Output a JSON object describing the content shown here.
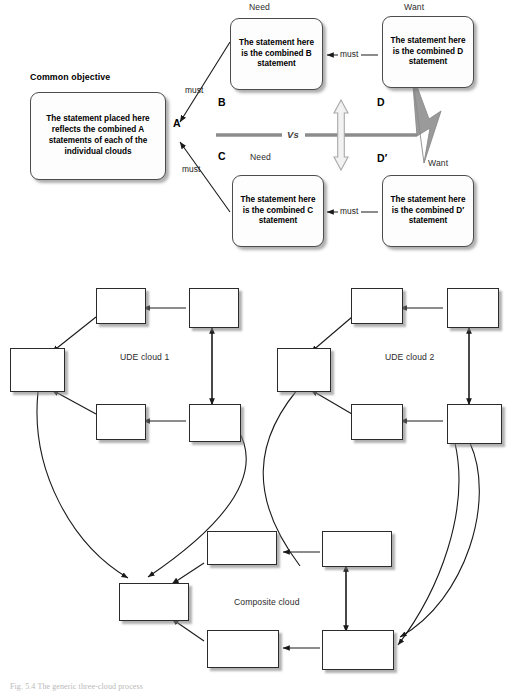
{
  "figure": {
    "caption": "Fig. 5.4  The generic three-cloud process",
    "top_diagram": {
      "name": "Combined / generic conflict cloud",
      "headers": {
        "common_objective": "Common objective",
        "need_top": "Need",
        "need_bottom": "Need",
        "want_top": "Want",
        "want_bottom": "Want"
      },
      "entity_letters": {
        "a": "A",
        "b": "B",
        "c": "C",
        "d": "D",
        "d_prime": "D′"
      },
      "boxes": {
        "a": "The statement placed here reflects the combined A statements of each of the individual clouds",
        "b": "The statement here is the combined B statement",
        "c": "The statement here is the combined C statement",
        "d": "The statement here is the combined D statement",
        "d_prime": "The statement here is the combined D′ statement"
      },
      "arrow_labels": {
        "must_ab": "must",
        "must_ac": "must",
        "must_bd": "must",
        "must_cdp": "must"
      },
      "conflict_label": "Vs",
      "icons": {
        "conflict": "lightning-bolt-icon",
        "tension": "double-headed-vertical-arrow-icon"
      }
    },
    "bottom_diagram": {
      "name": "Three-cloud composition",
      "labels": {
        "ude_cloud_1": "UDE cloud 1",
        "ude_cloud_2": "UDE cloud 2",
        "composite_cloud": "Composite cloud"
      },
      "clouds": [
        {
          "id": "ude-cloud-1",
          "label": "UDE cloud 1",
          "boxes": [
            {
              "id": "u1-a",
              "role": "objective",
              "text": ""
            },
            {
              "id": "u1-b",
              "role": "need-top",
              "text": ""
            },
            {
              "id": "u1-d",
              "role": "want-top",
              "text": ""
            },
            {
              "id": "u1-c",
              "role": "need-bottom",
              "text": ""
            },
            {
              "id": "u1-dp",
              "role": "want-bottom",
              "text": ""
            }
          ]
        },
        {
          "id": "ude-cloud-2",
          "label": "UDE cloud 2",
          "boxes": [
            {
              "id": "u2-a",
              "role": "objective",
              "text": ""
            },
            {
              "id": "u2-b",
              "role": "need-top",
              "text": ""
            },
            {
              "id": "u2-d",
              "role": "want-top",
              "text": ""
            },
            {
              "id": "u2-c",
              "role": "need-bottom",
              "text": ""
            },
            {
              "id": "u2-dp",
              "role": "want-bottom",
              "text": ""
            }
          ]
        },
        {
          "id": "composite-cloud",
          "label": "Composite cloud",
          "boxes": [
            {
              "id": "cc-a",
              "role": "objective",
              "text": ""
            },
            {
              "id": "cc-b",
              "role": "need-top",
              "text": ""
            },
            {
              "id": "cc-d",
              "role": "want-top",
              "text": ""
            },
            {
              "id": "cc-c",
              "role": "need-bottom",
              "text": ""
            },
            {
              "id": "cc-dp",
              "role": "want-bottom",
              "text": ""
            }
          ]
        }
      ]
    }
  },
  "colors": {
    "page_background": "#ffffff",
    "box_border": "#4c4c4c",
    "rect_border": "#2b2b2b",
    "shadow": "#7e7e7e",
    "connector": "#1a1a1a",
    "conflict_gray": "#8c8c8c",
    "caption_gray": "#b9b9b9"
  }
}
